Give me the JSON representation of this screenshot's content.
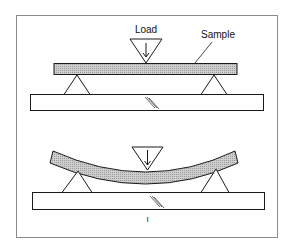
{
  "diagram": {
    "labels": {
      "load": "Load",
      "sample": "Sample",
      "mark": "I"
    },
    "states": [
      {
        "name": "before-loading",
        "sample_shape": "straight"
      },
      {
        "name": "under-load",
        "sample_shape": "bent"
      }
    ],
    "colors": {
      "frame": "#8a8a8a",
      "stroke": "#1a1a1a",
      "sample_fill": "#bdbdbd",
      "background": "#ffffff"
    }
  }
}
